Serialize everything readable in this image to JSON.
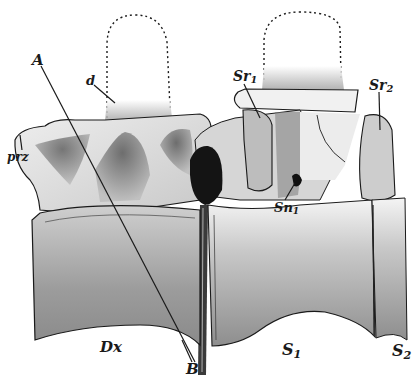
{
  "figure": {
    "colors": {
      "ink": "#1a1a1a",
      "bone_light": "#e4e4e4",
      "bone_mid": "#b9b9b9",
      "bone_dark": "#6e6e6e",
      "canal": "#111111",
      "background": "#ffffff"
    }
  },
  "labels": {
    "A": {
      "text": "A"
    },
    "B": {
      "text": "B"
    },
    "d": {
      "text": "d"
    },
    "prz": {
      "text": "prz"
    },
    "sr1": {
      "main": "Sr",
      "sub": "1"
    },
    "sr2": {
      "main": "Sr",
      "sub": "2"
    },
    "sn1": {
      "main": "Sn",
      "sub": "1"
    },
    "dx": {
      "text": "Dx"
    },
    "s1": {
      "main": "S",
      "sub": "1"
    },
    "s2": {
      "main": "S",
      "sub": "2"
    }
  }
}
